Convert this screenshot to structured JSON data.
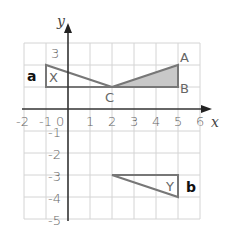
{
  "diagram": {
    "type": "coordinate-grid",
    "axes": {
      "x_label": "x",
      "y_label": "y",
      "x_range": [
        -2,
        6
      ],
      "y_range": [
        -5,
        3
      ],
      "x_ticks": [
        "-2",
        "-1",
        "0",
        "1",
        "2",
        "3",
        "4",
        "5",
        "6"
      ],
      "y_ticks": [
        "3",
        "-1",
        "-2",
        "-3",
        "-4",
        "-5"
      ]
    },
    "shapes": {
      "triangle_a": {
        "tag": "a",
        "label": "X",
        "vertices": [
          [
            -1,
            2
          ],
          [
            -1,
            1
          ],
          [
            2,
            1
          ]
        ]
      },
      "triangle_shaded": {
        "vertices": [
          [
            2,
            1
          ],
          [
            5,
            2
          ],
          [
            5,
            1
          ]
        ],
        "fill": "#c8c8c8"
      },
      "triangle_b": {
        "tag": "b",
        "label": "Y",
        "vertices": [
          [
            2,
            -3
          ],
          [
            5,
            -3
          ],
          [
            5,
            -4
          ]
        ]
      }
    },
    "points": {
      "A": "A",
      "B": "B",
      "C": "C"
    },
    "colors": {
      "grid": "#d4d4d4",
      "axis": "#333333",
      "shape": "#777777",
      "shade": "#c8c8c8"
    }
  }
}
